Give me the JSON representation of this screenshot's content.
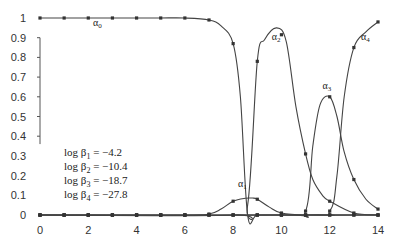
{
  "chart_data": {
    "type": "line",
    "title": "",
    "xlabel": "",
    "ylabel": "",
    "xlim": [
      0,
      14
    ],
    "ylim": [
      0,
      1
    ],
    "x_ticks": [
      "0",
      "2",
      "4",
      "6",
      "8",
      "10",
      "12",
      "14"
    ],
    "y_ticks": [
      "0",
      "0.1",
      "0.2",
      "0.3",
      "0.4",
      "0.5",
      "0.6",
      "0.7",
      "0.8",
      "0.9",
      "1"
    ],
    "grid": false,
    "legend": "none (inline curve labels)",
    "series": [
      {
        "name": "α0",
        "label_text": "α",
        "label_sub": "0",
        "x": [
          0,
          1,
          2,
          3,
          4,
          5,
          6,
          7,
          7.5,
          8,
          8.3,
          8.6,
          9,
          10,
          11,
          12,
          13,
          14
        ],
        "y": [
          1,
          1,
          1,
          1,
          1,
          1,
          1,
          0.99,
          0.96,
          0.87,
          0.6,
          0.0,
          0.0,
          0,
          0,
          0,
          0,
          0
        ]
      },
      {
        "name": "α1",
        "label_text": "α",
        "label_sub": "1",
        "x": [
          0,
          6,
          7,
          7.5,
          8,
          8.5,
          8.8,
          9,
          9.5,
          10,
          11,
          14
        ],
        "y": [
          0,
          0,
          0.005,
          0.03,
          0.07,
          0.085,
          0.086,
          0.08,
          0.04,
          0.01,
          0,
          0
        ]
      },
      {
        "name": "α2",
        "label_text": "α",
        "label_sub": "2",
        "x": [
          0,
          8,
          8.6,
          9,
          9.3,
          9.8,
          10.2,
          10.6,
          11,
          11.3,
          11.7,
          12,
          13,
          14
        ],
        "y": [
          0,
          0,
          0.05,
          0.78,
          0.89,
          0.95,
          0.88,
          0.55,
          0.31,
          0.18,
          0.1,
          0.07,
          0.01,
          0
        ]
      },
      {
        "name": "α3",
        "label_text": "α",
        "label_sub": "3",
        "x": [
          0,
          10,
          11,
          11.3,
          11.6,
          12,
          12.3,
          12.6,
          13,
          13.5,
          14
        ],
        "y": [
          0,
          0,
          0.02,
          0.35,
          0.56,
          0.6,
          0.5,
          0.32,
          0.18,
          0.08,
          0.03
        ]
      },
      {
        "name": "α4",
        "label_text": "α",
        "label_sub": "4",
        "x": [
          0,
          11,
          12,
          12.3,
          12.6,
          13,
          13.5,
          14
        ],
        "y": [
          0,
          0,
          0.02,
          0.2,
          0.6,
          0.85,
          0.93,
          0.98
        ]
      }
    ],
    "annotations": [
      {
        "text": "log β1 = −4.2"
      },
      {
        "text": "log β2 = −10.4"
      },
      {
        "text": "log β3 = −18.7"
      },
      {
        "text": "log β4 = −27.8"
      }
    ]
  },
  "annotations": {
    "lines": [
      {
        "prefix": "log β",
        "sub": "1",
        "rest": " = −4.2"
      },
      {
        "prefix": "log β",
        "sub": "2",
        "rest": " = −10.4"
      },
      {
        "prefix": "log β",
        "sub": "3",
        "rest": " = −18.7"
      },
      {
        "prefix": "log β",
        "sub": "4",
        "rest": " = −27.8"
      }
    ]
  }
}
